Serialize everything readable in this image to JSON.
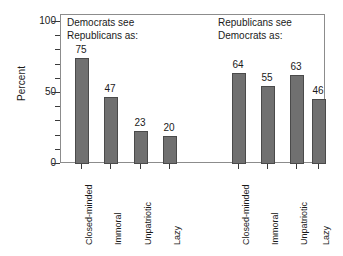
{
  "chart_data": {
    "type": "bar",
    "title": "",
    "subtitle": "",
    "xlabel": "",
    "ylabel": "Percent",
    "ylim": [
      0,
      100
    ],
    "yticks": [
      0,
      50,
      100
    ],
    "ytick_labels": [
      "0",
      "50",
      "100"
    ],
    "yminor_ticks": [
      10,
      20,
      30,
      40,
      60,
      70,
      80,
      90
    ],
    "grid": false,
    "legend": "none",
    "bar_color": "#707070",
    "bar_edge_color": "#4a4a4a",
    "frame_color": "#8c8c8c",
    "categories": [
      "Closed-minded",
      "Immoral",
      "Unpatriotic",
      "Lazy"
    ],
    "series": [
      {
        "name": "Democrats see Republicans as:",
        "title_line1": "Democrats see",
        "title_line2": "Republicans as:",
        "values": [
          75,
          47,
          23,
          20
        ]
      },
      {
        "name": "Republicans see Democrats as:",
        "title_line1": "Republicans see",
        "title_line2": "Democrats as:",
        "values": [
          64,
          55,
          63,
          46
        ]
      }
    ],
    "annotations": []
  },
  "axis": {
    "y_label": "Percent",
    "y_tick_0": "0",
    "y_tick_50": "50",
    "y_tick_100": "100"
  },
  "groups": [
    {
      "heading": "Democrats see\nRepublicans as:",
      "bars": [
        {
          "label": "Closed-minded",
          "value": "75"
        },
        {
          "label": "Immoral",
          "value": "47"
        },
        {
          "label": "Unpatriotic",
          "value": "23"
        },
        {
          "label": "Lazy",
          "value": "20"
        }
      ]
    },
    {
      "heading": "Republicans see\nDemocrats as:",
      "bars": [
        {
          "label": "Closed-minded",
          "value": "64"
        },
        {
          "label": "Immoral",
          "value": "55"
        },
        {
          "label": "Unpatriotic",
          "value": "63"
        },
        {
          "label": "Lazy",
          "value": "46"
        }
      ]
    }
  ]
}
